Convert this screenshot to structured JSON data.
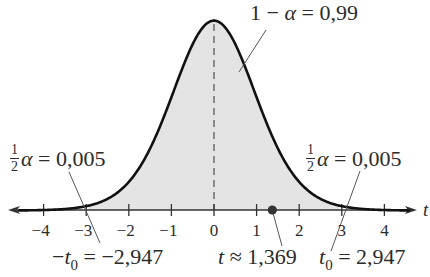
{
  "chart_data": {
    "type": "area",
    "title": "",
    "xlabel": "t",
    "ylabel": "",
    "xlim": [
      -4.6,
      4.6
    ],
    "x_ticks": [
      -4,
      -3,
      -2,
      -1,
      0,
      1,
      2,
      3,
      4
    ],
    "x_tick_labels": [
      "−4",
      "−3",
      "−2",
      "−1",
      "0",
      "1",
      "2",
      "3",
      "4"
    ],
    "grid": false,
    "legend": null,
    "series": [
      {
        "name": "t density (df = 15)",
        "df": 15,
        "shaded_interval": [
          -2.947,
          2.947
        ],
        "shaded_area": 0.99
      }
    ],
    "critical_values": {
      "neg_t0": -2.947,
      "t0": 2.947
    },
    "test_statistic": 1.369,
    "annotations": [
      {
        "id": "center-area",
        "text": "1 − α = 0,99"
      },
      {
        "id": "left-tail",
        "text": "½α = 0,005"
      },
      {
        "id": "right-tail",
        "text": "½α = 0,005"
      },
      {
        "id": "neg-critical",
        "text": "−t₀ = −2,947"
      },
      {
        "id": "test-stat",
        "text": "t ≈ 1,369"
      },
      {
        "id": "pos-critical",
        "text": "t₀ = 2,947"
      }
    ]
  },
  "labels": {
    "axis_var": "t",
    "center": {
      "lhs": "1 − ",
      "alpha": "α",
      "rhs": " = 0,99"
    },
    "left_tail": {
      "num": "1",
      "den": "2",
      "alpha": "α",
      "rhs": " = 0,005"
    },
    "right_tail": {
      "num": "1",
      "den": "2",
      "alpha": "α",
      "rhs": " = 0,005"
    },
    "neg_crit": {
      "minus": "−",
      "t": "t",
      "sub": "0",
      "rhs": " = −2,947"
    },
    "test_stat": {
      "t": "t",
      "rhs": " ≈ 1,369"
    },
    "pos_crit": {
      "t": "t",
      "sub": "0",
      "rhs": " = 2,947"
    }
  },
  "colors": {
    "curve": "#111111",
    "shade": "#e4e4e4",
    "axis": "#333333",
    "dashed": "#8a8a8a",
    "dot": "#333333"
  }
}
